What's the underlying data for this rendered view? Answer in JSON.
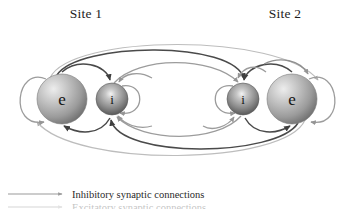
{
  "figure": {
    "title_left": "Site 1",
    "title_right": "Site 2",
    "background": "#ffffff"
  },
  "sites": [
    {
      "id": "site-1",
      "label": "Site 1",
      "label_x": 86,
      "label_y": 18,
      "nodes": [
        {
          "id": "e1",
          "letter": "e",
          "type": "excitatory",
          "cx": 62,
          "cy": 99,
          "r": 25
        },
        {
          "id": "i1",
          "letter": "i",
          "type": "inhibitory",
          "cx": 112,
          "cy": 99,
          "r": 16
        }
      ]
    },
    {
      "id": "site-2",
      "label": "Site 2",
      "label_x": 285,
      "label_y": 18,
      "nodes": [
        {
          "id": "i2",
          "letter": "i",
          "type": "inhibitory",
          "cx": 243,
          "cy": 99,
          "r": 16
        },
        {
          "id": "e2",
          "letter": "e",
          "type": "excitatory",
          "cx": 292,
          "cy": 99,
          "r": 25
        }
      ]
    }
  ],
  "legend": {
    "items": [
      {
        "id": "inhibitory",
        "label": "Inhibitory synaptic connections",
        "color": "#9a9a9a"
      },
      {
        "id": "excitatory",
        "label": "Excitatory synaptic connections",
        "color": "#3c3c3c"
      }
    ]
  },
  "colors": {
    "sphere_excitatory_highlight": "#e8e8e8",
    "sphere_excitatory_mid": "#a8a8a8",
    "sphere_excitatory_edge": "#6e6e6e",
    "sphere_inhibitory_highlight": "#f2f2f2",
    "sphere_inhibitory_mid": "#8a8a8a",
    "sphere_inhibitory_edge": "#4a4a4a",
    "arc_dark": "#4a4a4a",
    "arc_light": "#9c9c9c",
    "arc_faint": "#bdbdbd",
    "text": "#1d1d1d"
  },
  "connections": {
    "self_loops": [
      {
        "id": "e1-self",
        "node": "e1",
        "side": "left",
        "color": "#9c9c9c"
      },
      {
        "id": "e2-self",
        "node": "e2",
        "side": "right",
        "color": "#9c9c9c"
      },
      {
        "id": "i1-self",
        "node": "i1",
        "side": "right",
        "color": "#9c9c9c"
      },
      {
        "id": "i2-self",
        "node": "i2",
        "side": "left",
        "color": "#9c9c9c"
      }
    ],
    "local": [
      {
        "id": "e1-to-i1",
        "from": "e1",
        "to": "i1",
        "kind": "excitatory"
      },
      {
        "id": "i1-to-e1",
        "from": "i1",
        "to": "e1",
        "kind": "inhibitory"
      },
      {
        "id": "e2-to-i2",
        "from": "e2",
        "to": "i2",
        "kind": "excitatory"
      },
      {
        "id": "i2-to-e2",
        "from": "i2",
        "to": "e2",
        "kind": "inhibitory"
      }
    ],
    "long_range": [
      {
        "id": "e1-to-e2",
        "from": "e1",
        "to": "e2",
        "kind": "excitatory",
        "path": "top-outer"
      },
      {
        "id": "e1-to-i2",
        "from": "e1",
        "to": "i2",
        "kind": "excitatory",
        "path": "top-inner"
      },
      {
        "id": "e2-to-e1",
        "from": "e2",
        "to": "e1",
        "kind": "excitatory",
        "path": "bottom-outer"
      },
      {
        "id": "e2-to-i1",
        "from": "e2",
        "to": "i1",
        "kind": "excitatory",
        "path": "bottom-inner"
      },
      {
        "id": "i1-to-i2",
        "from": "i1",
        "to": "i2",
        "kind": "inhibitory",
        "path": "top-mid"
      },
      {
        "id": "i2-to-i1",
        "from": "i2",
        "to": "i1",
        "kind": "inhibitory",
        "path": "bottom-mid"
      }
    ]
  }
}
